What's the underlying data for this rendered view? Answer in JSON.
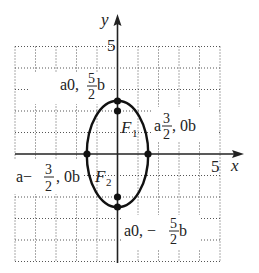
{
  "diagram": {
    "type": "ellipse-graph",
    "axes": {
      "x_label": "x",
      "y_label": "y",
      "x_tick_label": "5",
      "y_tick_label": "5",
      "x_range": [
        -5,
        5
      ],
      "y_range": [
        -5,
        5
      ],
      "grid": true
    },
    "ellipse": {
      "center": [
        0,
        0
      ],
      "semi_axis_x": 1.5,
      "semi_axis_y": 2.5
    },
    "points": [
      {
        "name": "top-vertex",
        "coords": [
          0,
          2.5
        ]
      },
      {
        "name": "bottom-vertex",
        "coords": [
          0,
          -2.5
        ]
      },
      {
        "name": "right-covertex",
        "coords": [
          1.5,
          0
        ]
      },
      {
        "name": "left-covertex",
        "coords": [
          -1.5,
          0
        ]
      },
      {
        "name": "focus-1",
        "coords": [
          0,
          2
        ]
      },
      {
        "name": "focus-2",
        "coords": [
          0,
          -2
        ]
      }
    ],
    "labels": {
      "top_vertex": {
        "open": "a0, ",
        "num": "5",
        "den": "2",
        "close": "b"
      },
      "bottom_vertex": {
        "open": "a0, − ",
        "num": "5",
        "den": "2",
        "close": "b"
      },
      "right_covertex": {
        "open": "a",
        "num": "3",
        "den": "2",
        "close": ", 0b"
      },
      "left_covertex": {
        "open": "a− ",
        "num": "3",
        "den": "2",
        "close": ", 0b"
      },
      "focus1": {
        "main": "F",
        "sub": "1"
      },
      "focus2": {
        "main": "F",
        "sub": "2"
      }
    }
  }
}
